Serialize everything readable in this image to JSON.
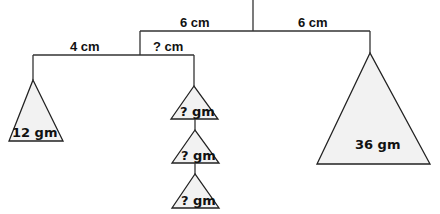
{
  "diagram": {
    "type": "balance-mobile",
    "colors": {
      "line": "#333333",
      "weight_fill": "#f2f2f2",
      "text": "#111111",
      "background": "#ffffff"
    },
    "distances": {
      "top_left_arm": "6 cm",
      "top_right_arm": "6 cm",
      "lower_left_arm": "4 cm",
      "lower_right_arm": "? cm"
    },
    "weights": {
      "left": "12 gm",
      "right": "36 gm",
      "middle_stack": [
        "? gm",
        "? gm",
        "? gm"
      ]
    }
  }
}
